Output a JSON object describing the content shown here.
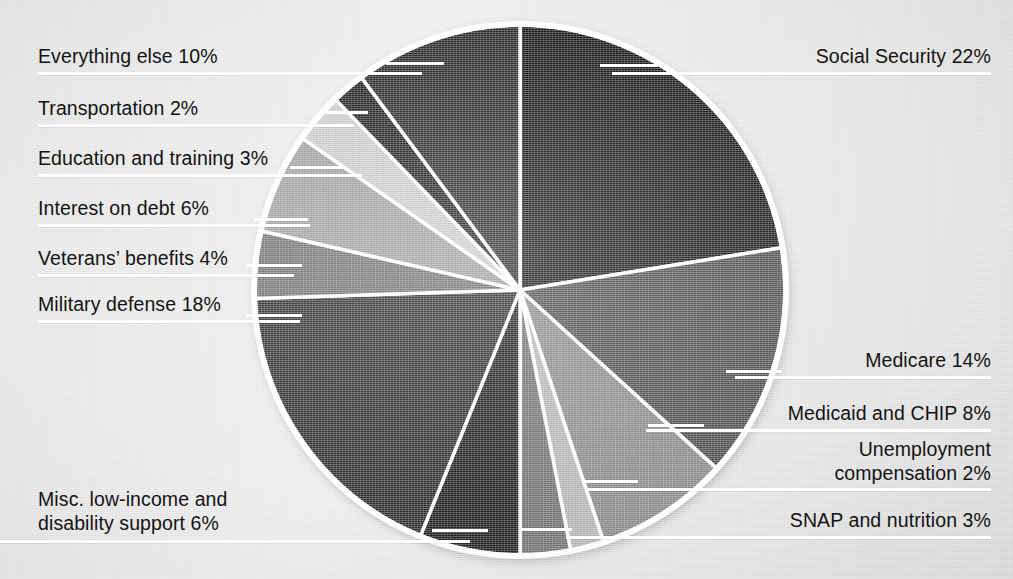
{
  "chart_data": {
    "type": "pie",
    "title": "",
    "unit": "percent",
    "total": 98,
    "start_angle_deg": 0,
    "direction": "clockwise",
    "center": {
      "x": 520,
      "y": 290
    },
    "radius": 265,
    "legend_position": "callout-labels",
    "categories": [
      "Social Security",
      "Medicare",
      "Medicaid and CHIP",
      "Unemployment compensation",
      "SNAP and nutrition",
      "Misc. low-income and disability support",
      "Military defense",
      "Veterans' benefits",
      "Interest on debt",
      "Education and training",
      "Transportation",
      "Everything else"
    ],
    "values": [
      22,
      14,
      8,
      2,
      3,
      6,
      18,
      4,
      6,
      3,
      2,
      10
    ],
    "colors": [
      "#141414",
      "#4a4a4a",
      "#878787",
      "#b4b4b4",
      "#6f6f6f",
      "#1d1d1d",
      "#2c2c2c",
      "#6d6d6d",
      "#9b9b9b",
      "#c9c9c9",
      "#1a1a1a",
      "#242424"
    ],
    "slice_stroke": "#ffffff",
    "background": "#e7e7e7"
  },
  "labels": {
    "everything_else": "Everything else 10%",
    "transportation": "Transportation 2%",
    "education": "Education and training 3%",
    "interest": "Interest on debt 6%",
    "veterans": "Veterans’ benefits 4%",
    "military": "Military defense 18%",
    "misc_low_income": "Misc. low-income and\ndisability support 6%",
    "social_security": "Social Security 22%",
    "medicare": "Medicare 14%",
    "medicaid": "Medicaid and CHIP 8%",
    "unemployment": "Unemployment\ncompensation 2%",
    "snap": "SNAP and nutrition 3%"
  }
}
